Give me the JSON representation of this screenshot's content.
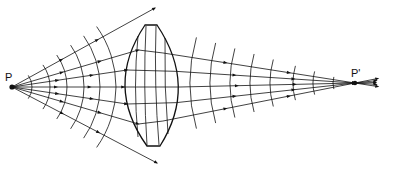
{
  "diagram": {
    "type": "optics-ray-diagram",
    "labels": {
      "source": "P",
      "image": "P'"
    },
    "points": {
      "source": {
        "x": 12,
        "y": 87
      },
      "image": {
        "x": 355,
        "y": 83
      }
    },
    "lens": {
      "shape": "biconvex",
      "top_flat": [
        [
          145,
          25
        ],
        [
          157,
          25
        ]
      ],
      "bottom_flat": [
        [
          147,
          146
        ],
        [
          160,
          146
        ]
      ],
      "left_vertex_x": 124,
      "right_vertex_x": 180
    },
    "outer_rays": [
      {
        "end": [
          155,
          8
        ]
      },
      {
        "end": [
          157,
          163
        ]
      }
    ],
    "lens_rays": [
      {
        "hit_y": 50
      },
      {
        "hit_y": 70
      },
      {
        "hit_y": 87
      },
      {
        "hit_y": 104
      },
      {
        "hit_y": 124
      }
    ],
    "output_rays_beyond_image": 5,
    "colors": {
      "line": "#111111",
      "background": "#ffffff"
    }
  }
}
